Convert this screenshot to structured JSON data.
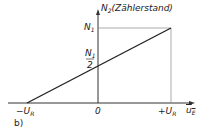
{
  "diagram": {
    "y_axis_label": "N",
    "y_axis_sub": "2",
    "y_axis_desc": "(Zählerstand)",
    "x_axis_label": "u",
    "x_axis_sub": "E",
    "y_ticks": {
      "n1": "N",
      "n1_sub": "1",
      "half_num": "N",
      "half_num_sub": "1",
      "half_den": "2"
    },
    "x_ticks": {
      "neg": "−U",
      "neg_sub": "R",
      "zero": "0",
      "pos": "+U",
      "pos_sub": "R"
    },
    "panel_label": "b)"
  }
}
